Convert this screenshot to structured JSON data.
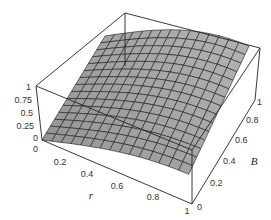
{
  "chart_data": {
    "type": "surface3d",
    "title": "",
    "xlabel": "r",
    "ylabel": "B",
    "zlabel": "",
    "x_ticks": [
      "0.2",
      "0.4",
      "0.6",
      "0.8",
      "1"
    ],
    "y_ticks": [
      "0",
      "0.2",
      "0.4",
      "0.6",
      "0.8",
      "1"
    ],
    "z_ticks": [
      "0",
      "0.25",
      "0.5",
      "0.75",
      "1"
    ],
    "x_origin_label": "0",
    "xlim": [
      0,
      1
    ],
    "ylim": [
      0,
      1
    ],
    "zlim": [
      0,
      1
    ],
    "grid_resolution": 15,
    "surface_color": "#a8a8a8",
    "mesh_color": "#1a1a1a",
    "box": true
  },
  "labels": {
    "z_ticks": [
      "1",
      "0.75",
      "0.5",
      "0.25",
      "0"
    ],
    "x_ticks": [
      "0",
      "0.2",
      "0.4",
      "0.6",
      "0.8",
      "1"
    ],
    "y_ticks": [
      "0",
      "0.2",
      "0.4",
      "0.6",
      "0.8",
      "1"
    ],
    "x_axis": "r",
    "y_axis": "B"
  }
}
